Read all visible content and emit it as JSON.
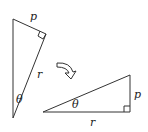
{
  "diagram": {
    "colors": {
      "stroke": "#333333",
      "text": "#222222",
      "background": "#ffffff"
    },
    "triangle_before": {
      "labels": {
        "top_leg": "p",
        "hypotenuse": "r",
        "angle": "θ"
      }
    },
    "arrow": {
      "icon": "curved-arrow-icon"
    },
    "triangle_after": {
      "labels": {
        "vertical_leg": "p",
        "bottom_leg": "r",
        "angle": "θ"
      }
    }
  }
}
